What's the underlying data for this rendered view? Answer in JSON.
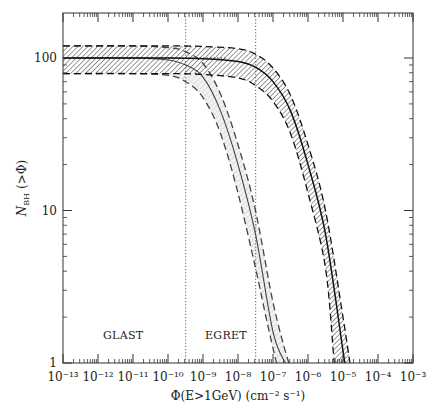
{
  "chart_data": {
    "type": "line",
    "title": "",
    "xlabel": "Φ(E>1GeV) (cm⁻² s⁻¹)",
    "ylabel": "N_BH (>Φ)",
    "xscale": "log",
    "yscale": "log",
    "xlim": [
      1e-13,
      0.001
    ],
    "ylim": [
      1,
      200
    ],
    "grid": false,
    "x_tick_labels": [
      "10⁻¹³",
      "10⁻¹²",
      "10⁻¹¹",
      "10⁻¹⁰",
      "10⁻⁹",
      "10⁻⁸",
      "10⁻⁷",
      "10⁻⁶",
      "10⁻⁵",
      "10⁻⁴",
      "10⁻³"
    ],
    "y_tick_labels": [
      "1",
      "10",
      "100"
    ],
    "annotations": [
      {
        "text": "GLAST",
        "x": 1e-11,
        "y": 1.5
      },
      {
        "text": "EGRET",
        "x": 4e-09,
        "y": 1.5
      }
    ],
    "vertical_lines": [
      {
        "name": "GLAST sensitivity",
        "x": 3.2e-10,
        "style": "dotted"
      },
      {
        "name": "EGRET sensitivity",
        "x": 3.2e-08,
        "style": "dotted"
      }
    ],
    "series": [
      {
        "name": "band A central (light shading)",
        "style": "solid",
        "logx": [
          -13,
          -11,
          -10,
          -9.5,
          -9,
          -8.5,
          -8,
          -7.5,
          -7,
          -6.65
        ],
        "values": [
          100,
          100,
          97,
          90,
          75,
          45,
          20,
          7,
          1.6,
          1
        ]
      },
      {
        "name": "band A upper",
        "style": "dashed",
        "logx": [
          -13,
          -11,
          -10,
          -9.5,
          -9,
          -8.5,
          -8,
          -7.5,
          -7,
          -6.55
        ],
        "values": [
          120,
          120,
          117,
          110,
          92,
          58,
          27,
          10,
          2.5,
          1
        ]
      },
      {
        "name": "band A lower",
        "style": "dashed",
        "logx": [
          -13,
          -11,
          -10,
          -9.5,
          -9,
          -8.5,
          -8,
          -7.5,
          -7.2,
          -6.9
        ],
        "values": [
          79,
          79,
          77,
          70,
          55,
          32,
          13,
          4.2,
          2,
          1
        ]
      },
      {
        "name": "band B central (hatched)",
        "style": "solid",
        "logx": [
          -13,
          -10,
          -9,
          -8,
          -7.5,
          -7,
          -6.5,
          -6,
          -5.5,
          -5,
          -4.95
        ],
        "values": [
          100,
          100,
          99,
          95,
          87,
          70,
          45,
          20,
          7,
          1.2,
          1
        ]
      },
      {
        "name": "band B upper",
        "style": "dashed",
        "logx": [
          -13,
          -10,
          -9,
          -8,
          -7.5,
          -7,
          -6.5,
          -6,
          -5.5,
          -5,
          -4.8
        ],
        "values": [
          120,
          120,
          119,
          115,
          106,
          86,
          57,
          27,
          10,
          2,
          1
        ]
      },
      {
        "name": "band B lower",
        "style": "dashed",
        "logx": [
          -13,
          -10,
          -9,
          -8,
          -7.5,
          -7,
          -6.5,
          -6,
          -5.5,
          -5.25
        ],
        "values": [
          79,
          79,
          78,
          74,
          66,
          52,
          32,
          13,
          4.2,
          1
        ]
      }
    ]
  },
  "labels": {
    "ylabel_main": "N",
    "ylabel_sub": "BH",
    "ylabel_rest": "(>Φ)",
    "xlabel": "Φ(E>1GeV) (cm⁻² s⁻¹)",
    "glast": "GLAST",
    "egret": "EGRET"
  }
}
